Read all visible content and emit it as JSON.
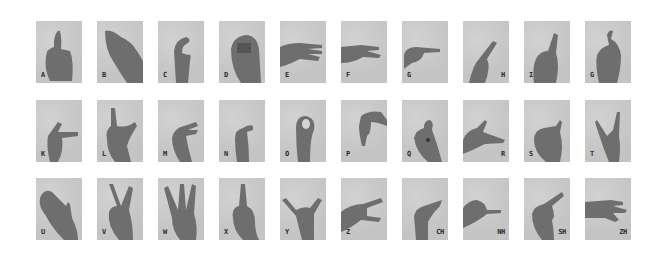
{
  "figure": {
    "rows": [
      {
        "cards": [
          {
            "letter": "A",
            "label_pos": "left",
            "gesture": "thumb-up"
          },
          {
            "letter": "B",
            "label_pos": "left",
            "gesture": "flat-hand"
          },
          {
            "letter": "C",
            "label_pos": "left",
            "gesture": "c-curve"
          },
          {
            "letter": "D",
            "label_pos": "left",
            "gesture": "fist"
          },
          {
            "letter": "E",
            "label_pos": "left",
            "gesture": "horizontal-fingers"
          },
          {
            "letter": "F",
            "label_pos": "left",
            "gesture": "two-fingers-side"
          },
          {
            "letter": "G",
            "label_pos": "left",
            "gesture": "point-right"
          },
          {
            "letter": "H",
            "label_pos": "right",
            "gesture": "two-fingers-diagonal"
          },
          {
            "letter": "I",
            "label_pos": "left",
            "gesture": "index-up"
          },
          {
            "letter": "G",
            "label_pos": "left",
            "gesture": "hook-up"
          }
        ]
      },
      {
        "cards": [
          {
            "letter": "K",
            "label_pos": "left",
            "gesture": "index-thumb"
          },
          {
            "letter": "L",
            "label_pos": "left",
            "gesture": "l-shape"
          },
          {
            "letter": "M",
            "label_pos": "left",
            "gesture": "curled-side"
          },
          {
            "letter": "N",
            "label_pos": "left",
            "gesture": "bent-fingers"
          },
          {
            "letter": "O",
            "label_pos": "left",
            "gesture": "o-ring"
          },
          {
            "letter": "P",
            "label_pos": "left",
            "gesture": "point-down"
          },
          {
            "letter": "Q",
            "label_pos": "left",
            "gesture": "pinch"
          },
          {
            "letter": "R",
            "label_pos": "right",
            "gesture": "gun"
          },
          {
            "letter": "S",
            "label_pos": "left",
            "gesture": "fist-thumb"
          },
          {
            "letter": "T",
            "label_pos": "left",
            "gesture": "horns"
          }
        ]
      },
      {
        "cards": [
          {
            "letter": "U",
            "label_pos": "left",
            "gesture": "flat-tilted"
          },
          {
            "letter": "V",
            "label_pos": "left",
            "gesture": "v-sign"
          },
          {
            "letter": "W",
            "label_pos": "left",
            "gesture": "three-fingers"
          },
          {
            "letter": "X",
            "label_pos": "left",
            "gesture": "crossed-fingers"
          },
          {
            "letter": "Y",
            "label_pos": "left",
            "gesture": "shaka"
          },
          {
            "letter": "Z",
            "label_pos": "left",
            "gesture": "side-horns"
          },
          {
            "letter": "CH",
            "label_pos": "right",
            "gesture": "beak"
          },
          {
            "letter": "NH",
            "label_pos": "right",
            "gesture": "point-side"
          },
          {
            "letter": "SH",
            "label_pos": "right",
            "gesture": "hook-diagonal"
          },
          {
            "letter": "ZH",
            "label_pos": "right",
            "gesture": "side-three"
          }
        ]
      }
    ],
    "colors": {
      "page_bg": "#ffffff",
      "card_bg": "#c8c8c8",
      "hand": "#6e6e6e",
      "label": "#2a2a2a"
    }
  }
}
